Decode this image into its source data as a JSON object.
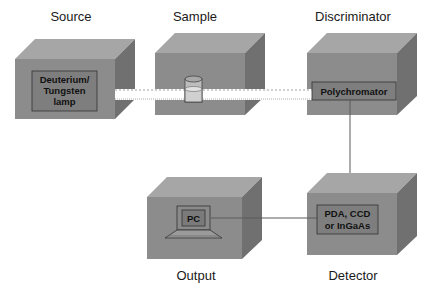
{
  "diagram": {
    "colors": {
      "box_front": "#8c8c8c",
      "box_top": "#a6a6a6",
      "box_side": "#707070",
      "inner_panel": "#7e7e7e",
      "beam": "#ffffff",
      "connector": "#5a5a5a"
    },
    "components": [
      {
        "id": "source",
        "title": "Source",
        "inner_label_lines": [
          "Deuterium/",
          "Tungsten",
          "lamp"
        ]
      },
      {
        "id": "sample",
        "title": "Sample",
        "inner_label_lines": [],
        "icon": "cuvette-icon"
      },
      {
        "id": "discriminator",
        "title": "Discriminator",
        "inner_label_lines": [
          "Polychromator"
        ]
      },
      {
        "id": "output",
        "title": "Output",
        "inner_label_lines": [
          "PC"
        ],
        "icon": "laptop-icon"
      },
      {
        "id": "detector",
        "title": "Detector",
        "inner_label_lines": [
          "PDA, CCD",
          "or InGaAs"
        ]
      }
    ],
    "connections": [
      {
        "from": "source",
        "to": "sample",
        "type": "light-beam"
      },
      {
        "from": "sample",
        "to": "discriminator",
        "type": "light-beam"
      },
      {
        "from": "discriminator",
        "to": "detector",
        "type": "line"
      },
      {
        "from": "detector",
        "to": "output",
        "type": "line"
      }
    ]
  }
}
